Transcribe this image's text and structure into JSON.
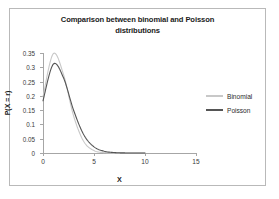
{
  "chart_data": {
    "type": "line",
    "title": "Comparison between binomial and Poisson distributions",
    "title_line1": "Comparison between binomial and Poisson",
    "title_line2": "distributions",
    "xlabel": "X",
    "ylabel": "P(X = r)",
    "xlim": [
      0,
      15
    ],
    "ylim": [
      0,
      0.35
    ],
    "xticks": [
      0,
      5,
      10,
      15
    ],
    "xtick_labels": [
      "0",
      "5",
      "10",
      "15"
    ],
    "yticks": [
      0,
      0.05,
      0.1,
      0.15,
      0.2,
      0.25,
      0.3,
      0.35
    ],
    "ytick_labels": [
      "0",
      "0.05",
      "0.1",
      "0.15",
      "0.2",
      "0.25",
      "0.3",
      "0.35"
    ],
    "grid": false,
    "legend_position": "right",
    "series": [
      {
        "name": "Binomial",
        "color": "#c8c8c8",
        "x": [
          0,
          1,
          2,
          3,
          4,
          5,
          6,
          7,
          8,
          9,
          10
        ],
        "values": [
          0.1969,
          0.3474,
          0.2759,
          0.1298,
          0.0401,
          0.0085,
          0.0012,
          0.0001,
          0.0,
          0.0,
          0.0
        ]
      },
      {
        "name": "Poisson",
        "color": "#555555",
        "x": [
          0,
          1,
          2,
          3,
          4,
          5,
          6,
          7,
          8,
          9,
          10
        ],
        "values": [
          0.1827,
          0.3106,
          0.264,
          0.1496,
          0.0636,
          0.0216,
          0.0061,
          0.0015,
          0.0003,
          0.0001,
          0.0
        ]
      }
    ],
    "curve_peak": {
      "x": 1.3,
      "y": 0.3
    },
    "curve_start": {
      "x": 0,
      "y": 0.18
    }
  },
  "legend": {
    "items": [
      {
        "label": "Binomial",
        "color": "#c8c8c8"
      },
      {
        "label": "Poisson",
        "color": "#555555"
      }
    ]
  },
  "colors": {
    "frame_border": "#b9b9b9",
    "axis": "#a6a6a6",
    "text": "#1b1b1b",
    "background": "#ffffff"
  }
}
